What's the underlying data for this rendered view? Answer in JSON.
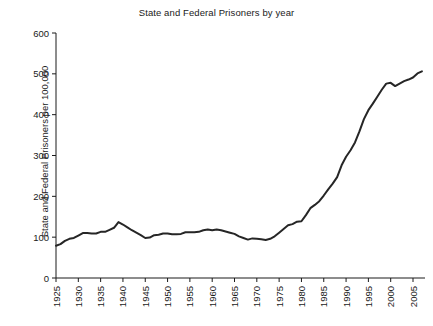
{
  "chart_data": {
    "type": "line",
    "title": "State and Federal Prisoners by year",
    "xlabel": "",
    "ylabel": "State and Federal Prisoners per 100,000",
    "xlim": [
      1925,
      2009
    ],
    "ylim": [
      0,
      600
    ],
    "grid": false,
    "legend": null,
    "xticks": [
      1925,
      1930,
      1935,
      1940,
      1945,
      1950,
      1955,
      1960,
      1965,
      1970,
      1975,
      1980,
      1985,
      1990,
      1995,
      2000,
      2005
    ],
    "yticks": [
      0,
      100,
      200,
      300,
      400,
      500,
      600
    ],
    "xtick_labels": [
      "1925",
      "1930",
      "1935",
      "1940",
      "1945",
      "1950",
      "1955",
      "1960",
      "1965",
      "1970",
      "1975",
      "1980",
      "1985",
      "1990",
      "1995",
      "2000",
      "2005"
    ],
    "ytick_labels": [
      "0",
      "100",
      "200",
      "300",
      "400",
      "500",
      "600"
    ],
    "line_color": "#262626",
    "series": [
      {
        "name": "State and Federal Prisoners per 100,000",
        "x": [
          1925,
          1926,
          1927,
          1928,
          1929,
          1930,
          1931,
          1932,
          1933,
          1934,
          1935,
          1936,
          1937,
          1938,
          1939,
          1940,
          1941,
          1942,
          1943,
          1944,
          1945,
          1946,
          1947,
          1948,
          1949,
          1950,
          1951,
          1952,
          1953,
          1954,
          1955,
          1956,
          1957,
          1958,
          1959,
          1960,
          1961,
          1962,
          1963,
          1964,
          1965,
          1966,
          1967,
          1968,
          1969,
          1970,
          1971,
          1972,
          1973,
          1974,
          1975,
          1976,
          1977,
          1978,
          1979,
          1980,
          1981,
          1982,
          1983,
          1984,
          1985,
          1986,
          1987,
          1988,
          1989,
          1990,
          1991,
          1992,
          1993,
          1994,
          1995,
          1996,
          1997,
          1998,
          1999,
          2000,
          2001,
          2002,
          2003,
          2004,
          2005,
          2006,
          2007
        ],
        "y": [
          79,
          83,
          91,
          96,
          98,
          104,
          110,
          110,
          109,
          109,
          113,
          113,
          118,
          123,
          137,
          131,
          124,
          117,
          111,
          105,
          98,
          99,
          105,
          106,
          109,
          109,
          107,
          107,
          108,
          112,
          112,
          112,
          113,
          117,
          119,
          117,
          119,
          117,
          114,
          111,
          108,
          102,
          98,
          94,
          97,
          96,
          95,
          93,
          96,
          102,
          111,
          120,
          129,
          132,
          138,
          139,
          154,
          171,
          179,
          188,
          202,
          217,
          231,
          247,
          276,
          297,
          313,
          332,
          359,
          389,
          411,
          427,
          444,
          461,
          476,
          478,
          470,
          476,
          482,
          486,
          491,
          501,
          506
        ]
      }
    ]
  }
}
